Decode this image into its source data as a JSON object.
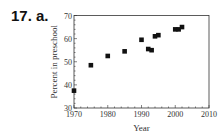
{
  "problem_label": "17. a.",
  "chart_data": {
    "type": "scatter",
    "title": "",
    "xlabel": "Year",
    "ylabel": "Percent in preschool",
    "xlim": [
      1970,
      2010
    ],
    "ylim": [
      30,
      70
    ],
    "xticks": [
      1970,
      1980,
      1990,
      2000,
      2010
    ],
    "yticks": [
      30,
      40,
      50,
      60,
      70
    ],
    "grid": false,
    "legend": null,
    "x": [
      1970,
      1975,
      1980,
      1985,
      1990,
      1992,
      1993,
      1994,
      1995,
      2000,
      2001,
      2002
    ],
    "y": [
      37.5,
      48.5,
      52.5,
      54.5,
      59.5,
      55.5,
      55,
      61,
      61.5,
      64,
      64,
      65
    ]
  }
}
